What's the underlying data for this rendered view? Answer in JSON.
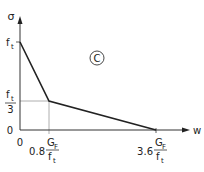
{
  "diagram": {
    "type": "bilinear softening curve",
    "y_axis_label": "σ",
    "x_axis_label": "w",
    "origin_y_label": "0",
    "origin_x_label": "0",
    "y_tick_top": {
      "num": "f",
      "sub": "t"
    },
    "y_tick_mid": {
      "num": "f",
      "sub": "t",
      "den": "3"
    },
    "x_tick_1": {
      "coef": "0.8",
      "num": "G",
      "num_sub": "F",
      "den": "f",
      "den_sub": "t"
    },
    "x_tick_2": {
      "coef": "3.6",
      "num": "G",
      "num_sub": "F",
      "den": "f",
      "den_sub": "t"
    },
    "panel_marker": "C",
    "points": [
      {
        "w": "0",
        "sigma": "f_t"
      },
      {
        "w": "0.8 G_F/f_t",
        "sigma": "f_t/3"
      },
      {
        "w": "3.6 G_F/f_t",
        "sigma": "0"
      }
    ],
    "line_color": "#222222",
    "guide_color": "#888888"
  }
}
